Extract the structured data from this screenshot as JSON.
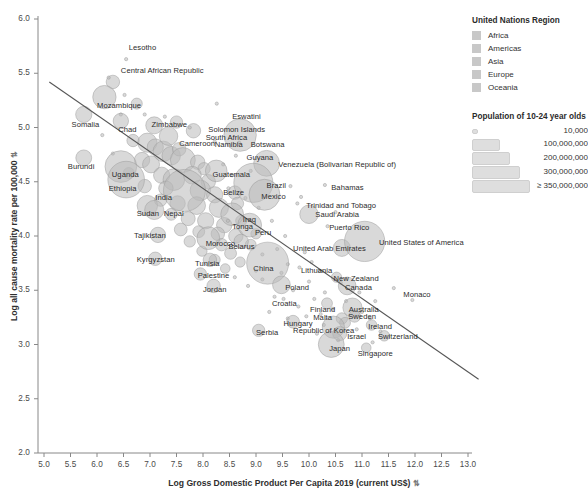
{
  "chart_data": {
    "type": "scatter",
    "title": "",
    "xlabel": "Log Gross Domestic Product Per Capita 2019 (current US$)",
    "ylabel": "Log all cause mortality rate per 100,000",
    "xlim": [
      5.0,
      13.0
    ],
    "ylim": [
      2.0,
      6.0
    ],
    "xticks": [
      "5.0",
      "5.5",
      "6.0",
      "6.5",
      "7.0",
      "7.5",
      "8.0",
      "8.5",
      "9.0",
      "9.5",
      "10.0",
      "10.5",
      "11.0",
      "11.5",
      "12.0",
      "12.5",
      "13.0"
    ],
    "yticks": [
      "2.0",
      "2.5",
      "3.0",
      "3.5",
      "4.0",
      "4.5",
      "5.0",
      "5.5",
      "6.0"
    ],
    "grid": false,
    "trendline": {
      "x1": 5.1,
      "y1": 5.42,
      "x2": 13.2,
      "y2": 2.68
    },
    "points": [
      {
        "label": "Lesotho",
        "x": 6.55,
        "y": 5.63,
        "size": 10000,
        "lx": 6.6,
        "ly": 5.73
      },
      {
        "label": "Central African Republic",
        "x": 6.22,
        "y": 5.46,
        "size": 12000,
        "lx": 6.45,
        "ly": 5.52
      },
      {
        "label": "Mozambique",
        "x": 6.14,
        "y": 5.28,
        "size": 95000000,
        "lx": 6.0,
        "ly": 5.2
      },
      {
        "label": "Eswatini",
        "x": 8.26,
        "y": 5.22,
        "size": 9000,
        "lx": 8.55,
        "ly": 5.1
      },
      {
        "label": "Somalia",
        "x": 5.75,
        "y": 5.12,
        "size": 40000000,
        "lx": 5.52,
        "ly": 5.02
      },
      {
        "label": "Chad",
        "x": 6.45,
        "y": 5.06,
        "size": 35000000,
        "lx": 6.4,
        "ly": 4.98
      },
      {
        "label": "Zimbabwe",
        "x": 7.08,
        "y": 5.02,
        "size": 45000000,
        "lx": 7.03,
        "ly": 5.02
      },
      {
        "label": "Solomon Islands",
        "x": 7.75,
        "y": 5.0,
        "size": 9000,
        "lx": 8.1,
        "ly": 4.98
      },
      {
        "label": "South Africa",
        "x": 8.7,
        "y": 4.93,
        "size": 200000000,
        "lx": 8.05,
        "ly": 4.9
      },
      {
        "label": "Cameroon",
        "x": 7.35,
        "y": 4.92,
        "size": 55000000,
        "lx": 7.55,
        "ly": 4.85
      },
      {
        "label": "Namibia",
        "x": 8.22,
        "y": 4.87,
        "size": 10000,
        "lx": 8.22,
        "ly": 4.84
      },
      {
        "label": "Botswana",
        "x": 8.68,
        "y": 4.86,
        "size": 11000,
        "lx": 8.9,
        "ly": 4.84
      },
      {
        "label": "Guyana",
        "x": 8.62,
        "y": 4.74,
        "size": 9000,
        "lx": 8.82,
        "ly": 4.72
      },
      {
        "label": "Burundi",
        "x": 5.75,
        "y": 4.72,
        "size": 38000000,
        "lx": 5.45,
        "ly": 4.64
      },
      {
        "label": "Venezuela (Bolivarian Republic of)",
        "x": 9.2,
        "y": 4.67,
        "size": 120000000,
        "lx": 9.42,
        "ly": 4.65
      },
      {
        "label": "Uganda",
        "x": 6.45,
        "y": 4.64,
        "size": 190000000,
        "lx": 6.28,
        "ly": 4.56
      },
      {
        "label": "Guatemala",
        "x": 8.25,
        "y": 4.6,
        "size": 80000000,
        "lx": 8.18,
        "ly": 4.56
      },
      {
        "label": "Ethiopia",
        "x": 6.55,
        "y": 4.52,
        "size": 260000000,
        "lx": 6.22,
        "ly": 4.43
      },
      {
        "label": "Brazil",
        "x": 8.95,
        "y": 4.49,
        "size": 300000000,
        "lx": 9.2,
        "ly": 4.46
      },
      {
        "label": "Bahamas",
        "x": 10.3,
        "y": 4.47,
        "size": 8000,
        "lx": 10.42,
        "ly": 4.44
      },
      {
        "label": "India",
        "x": 7.65,
        "y": 4.42,
        "size": 350000000,
        "lx": 7.1,
        "ly": 4.35
      },
      {
        "label": "Belize",
        "x": 8.48,
        "y": 4.44,
        "size": 9000,
        "lx": 8.38,
        "ly": 4.4
      },
      {
        "label": "Mexico",
        "x": 9.16,
        "y": 4.38,
        "size": 180000000,
        "lx": 9.1,
        "ly": 4.36
      },
      {
        "label": "Trinidad and Tobago",
        "x": 9.78,
        "y": 4.3,
        "size": 9000,
        "lx": 9.95,
        "ly": 4.28
      },
      {
        "label": "Sudan",
        "x": 6.95,
        "y": 4.28,
        "size": 70000000,
        "lx": 6.75,
        "ly": 4.2
      },
      {
        "label": "Nepal",
        "x": 7.08,
        "y": 4.24,
        "size": 60000000,
        "lx": 7.26,
        "ly": 4.2
      },
      {
        "label": "Saudi Arabia",
        "x": 10.0,
        "y": 4.2,
        "size": 55000000,
        "lx": 10.12,
        "ly": 4.19
      },
      {
        "label": "Iraq",
        "x": 8.55,
        "y": 4.2,
        "size": 90000000,
        "lx": 8.75,
        "ly": 4.15
      },
      {
        "label": "Tonga",
        "x": 8.47,
        "y": 4.14,
        "size": 8000,
        "lx": 8.55,
        "ly": 4.08
      },
      {
        "label": "Peru",
        "x": 8.88,
        "y": 4.1,
        "size": 100000000,
        "lx": 8.98,
        "ly": 4.03
      },
      {
        "label": "Puerto Rico",
        "x": 10.35,
        "y": 4.09,
        "size": 9000,
        "lx": 10.38,
        "ly": 4.07
      },
      {
        "label": "Tajikistan",
        "x": 7.15,
        "y": 4.01,
        "size": 35000000,
        "lx": 6.7,
        "ly": 4.0
      },
      {
        "label": "Morocco",
        "x": 8.1,
        "y": 3.98,
        "size": 90000000,
        "lx": 8.05,
        "ly": 3.93
      },
      {
        "label": "Belarus",
        "x": 8.72,
        "y": 3.95,
        "size": 30000000,
        "lx": 8.48,
        "ly": 3.9
      },
      {
        "label": "United Arab Emirates",
        "x": 10.62,
        "y": 3.89,
        "size": 45000000,
        "lx": 9.7,
        "ly": 3.88
      },
      {
        "label": "United States of America",
        "x": 11.05,
        "y": 3.95,
        "size": 320000000,
        "lx": 11.32,
        "ly": 3.94
      },
      {
        "label": "Kyrgyzstan",
        "x": 7.1,
        "y": 3.79,
        "size": 25000000,
        "lx": 6.75,
        "ly": 3.78
      },
      {
        "label": "Tunisia",
        "x": 8.13,
        "y": 3.78,
        "size": 25000000,
        "lx": 7.85,
        "ly": 3.74
      },
      {
        "label": "China",
        "x": 9.22,
        "y": 3.75,
        "size": 350000000,
        "lx": 8.95,
        "ly": 3.7
      },
      {
        "label": "Lithuania",
        "x": 9.82,
        "y": 3.71,
        "size": 9000,
        "lx": 9.85,
        "ly": 3.68
      },
      {
        "label": "Palestine",
        "x": 7.95,
        "y": 3.65,
        "size": 20000000,
        "lx": 7.9,
        "ly": 3.63
      },
      {
        "label": "New Zealand",
        "x": 10.52,
        "y": 3.62,
        "size": 12000000,
        "lx": 10.46,
        "ly": 3.6
      },
      {
        "label": "Poland",
        "x": 9.48,
        "y": 3.55,
        "size": 50000000,
        "lx": 9.55,
        "ly": 3.52
      },
      {
        "label": "Canada",
        "x": 10.72,
        "y": 3.54,
        "size": 50000000,
        "lx": 10.68,
        "ly": 3.52
      },
      {
        "label": "Jordan",
        "x": 8.2,
        "y": 3.54,
        "size": 25000000,
        "lx": 8.0,
        "ly": 3.5
      },
      {
        "label": "Monaco",
        "x": 11.95,
        "y": 3.41,
        "size": 6000,
        "lx": 11.78,
        "ly": 3.46
      },
      {
        "label": "Croatia",
        "x": 9.52,
        "y": 3.42,
        "size": 9000,
        "lx": 9.3,
        "ly": 3.37
      },
      {
        "label": "Finland",
        "x": 10.34,
        "y": 3.38,
        "size": 14000000,
        "lx": 10.02,
        "ly": 3.32
      },
      {
        "label": "Australia",
        "x": 10.82,
        "y": 3.34,
        "size": 60000000,
        "lx": 10.75,
        "ly": 3.32
      },
      {
        "label": "Malta",
        "x": 10.22,
        "y": 3.28,
        "size": 7000,
        "lx": 10.08,
        "ly": 3.24
      },
      {
        "label": "Sweden",
        "x": 10.86,
        "y": 3.26,
        "size": 18000000,
        "lx": 10.74,
        "ly": 3.25
      },
      {
        "label": "Hungary",
        "x": 9.7,
        "y": 3.21,
        "size": 22000000,
        "lx": 9.52,
        "ly": 3.19
      },
      {
        "label": "Republic of Korea",
        "x": 10.46,
        "y": 3.16,
        "size": 85000000,
        "lx": 9.7,
        "ly": 3.12
      },
      {
        "label": "Serbia",
        "x": 9.05,
        "y": 3.13,
        "size": 20000000,
        "lx": 9.0,
        "ly": 3.11
      },
      {
        "label": "Ireland",
        "x": 11.18,
        "y": 3.18,
        "size": 13000000,
        "lx": 11.12,
        "ly": 3.16
      },
      {
        "label": "Israel",
        "x": 10.58,
        "y": 3.1,
        "size": 28000000,
        "lx": 10.72,
        "ly": 3.07
      },
      {
        "label": "Switzerland",
        "x": 11.42,
        "y": 3.08,
        "size": 13000000,
        "lx": 11.3,
        "ly": 3.07
      },
      {
        "label": "Japan",
        "x": 10.42,
        "y": 3.0,
        "size": 120000000,
        "lx": 10.38,
        "ly": 2.96
      },
      {
        "label": "Singapore",
        "x": 11.08,
        "y": 2.97,
        "size": 10000000,
        "lx": 10.92,
        "ly": 2.91
      }
    ],
    "extra_points": [
      {
        "x": 6.3,
        "y": 5.42,
        "size": 25000000
      },
      {
        "x": 6.52,
        "y": 5.3,
        "size": 12000
      },
      {
        "x": 6.75,
        "y": 5.22,
        "size": 15000000
      },
      {
        "x": 6.9,
        "y": 5.12,
        "size": 10000
      },
      {
        "x": 7.28,
        "y": 5.1,
        "size": 9000
      },
      {
        "x": 7.5,
        "y": 5.05,
        "size": 20000000
      },
      {
        "x": 7.82,
        "y": 4.97,
        "size": 30000000
      },
      {
        "x": 6.1,
        "y": 4.93,
        "size": 12000
      },
      {
        "x": 6.68,
        "y": 4.88,
        "size": 20000000
      },
      {
        "x": 6.95,
        "y": 4.86,
        "size": 60000000
      },
      {
        "x": 7.1,
        "y": 4.82,
        "size": 40000000
      },
      {
        "x": 7.25,
        "y": 4.78,
        "size": 70000000
      },
      {
        "x": 7.4,
        "y": 4.74,
        "size": 55000000
      },
      {
        "x": 7.55,
        "y": 4.8,
        "size": 25000000
      },
      {
        "x": 6.3,
        "y": 4.76,
        "size": 9000
      },
      {
        "x": 6.85,
        "y": 4.7,
        "size": 35000000
      },
      {
        "x": 7.02,
        "y": 4.66,
        "size": 45000000
      },
      {
        "x": 7.62,
        "y": 4.7,
        "size": 110000000
      },
      {
        "x": 7.9,
        "y": 4.68,
        "size": 30000000
      },
      {
        "x": 8.02,
        "y": 4.62,
        "size": 20000000
      },
      {
        "x": 8.38,
        "y": 4.66,
        "size": 9000
      },
      {
        "x": 6.6,
        "y": 4.58,
        "size": 15000000
      },
      {
        "x": 7.22,
        "y": 4.56,
        "size": 40000000
      },
      {
        "x": 7.45,
        "y": 4.52,
        "size": 80000000
      },
      {
        "x": 7.8,
        "y": 4.56,
        "size": 50000000
      },
      {
        "x": 8.1,
        "y": 4.5,
        "size": 30000000
      },
      {
        "x": 8.55,
        "y": 4.56,
        "size": 9000
      },
      {
        "x": 6.9,
        "y": 4.46,
        "size": 25000000
      },
      {
        "x": 7.3,
        "y": 4.44,
        "size": 30000000
      },
      {
        "x": 7.95,
        "y": 4.42,
        "size": 70000000
      },
      {
        "x": 8.22,
        "y": 4.38,
        "size": 40000000
      },
      {
        "x": 8.6,
        "y": 4.4,
        "size": 25000000
      },
      {
        "x": 8.8,
        "y": 4.35,
        "size": 12000
      },
      {
        "x": 7.2,
        "y": 4.33,
        "size": 20000000
      },
      {
        "x": 7.52,
        "y": 4.3,
        "size": 35000000
      },
      {
        "x": 7.88,
        "y": 4.28,
        "size": 50000000
      },
      {
        "x": 8.3,
        "y": 4.26,
        "size": 60000000
      },
      {
        "x": 8.65,
        "y": 4.3,
        "size": 20000000
      },
      {
        "x": 9.05,
        "y": 4.26,
        "size": 10000
      },
      {
        "x": 7.4,
        "y": 4.2,
        "size": 18000000
      },
      {
        "x": 7.72,
        "y": 4.16,
        "size": 28000000
      },
      {
        "x": 8.05,
        "y": 4.14,
        "size": 40000000
      },
      {
        "x": 8.4,
        "y": 4.1,
        "size": 35000000
      },
      {
        "x": 8.72,
        "y": 4.14,
        "size": 15000000
      },
      {
        "x": 9.3,
        "y": 4.14,
        "size": 9000
      },
      {
        "x": 7.58,
        "y": 4.06,
        "size": 22000000
      },
      {
        "x": 7.92,
        "y": 4.04,
        "size": 18000000
      },
      {
        "x": 8.28,
        "y": 4.02,
        "size": 25000000
      },
      {
        "x": 8.62,
        "y": 4.0,
        "size": 30000000
      },
      {
        "x": 9.0,
        "y": 4.02,
        "size": 12000000
      },
      {
        "x": 9.55,
        "y": 4.0,
        "size": 8000
      },
      {
        "x": 7.75,
        "y": 3.95,
        "size": 16000000
      },
      {
        "x": 8.35,
        "y": 3.92,
        "size": 20000000
      },
      {
        "x": 8.9,
        "y": 3.92,
        "size": 14000000
      },
      {
        "x": 9.4,
        "y": 3.88,
        "size": 10000
      },
      {
        "x": 7.98,
        "y": 3.86,
        "size": 12000000
      },
      {
        "x": 8.52,
        "y": 3.84,
        "size": 18000000
      },
      {
        "x": 9.12,
        "y": 3.83,
        "size": 9000
      },
      {
        "x": 9.92,
        "y": 3.85,
        "size": 9000
      },
      {
        "x": 8.22,
        "y": 3.78,
        "size": 15000000
      },
      {
        "x": 8.7,
        "y": 3.76,
        "size": 12000000
      },
      {
        "x": 9.6,
        "y": 3.74,
        "size": 8000
      },
      {
        "x": 10.05,
        "y": 3.76,
        "size": 9000
      },
      {
        "x": 8.42,
        "y": 3.7,
        "size": 10000000
      },
      {
        "x": 9.0,
        "y": 3.68,
        "size": 9000
      },
      {
        "x": 9.48,
        "y": 3.66,
        "size": 8000
      },
      {
        "x": 10.2,
        "y": 3.68,
        "size": 9000
      },
      {
        "x": 8.6,
        "y": 3.62,
        "size": 9000
      },
      {
        "x": 9.12,
        "y": 3.6,
        "size": 10000
      },
      {
        "x": 10.0,
        "y": 3.58,
        "size": 9000
      },
      {
        "x": 10.6,
        "y": 3.57,
        "size": 12000
      },
      {
        "x": 8.85,
        "y": 3.54,
        "size": 8000
      },
      {
        "x": 9.7,
        "y": 3.5,
        "size": 9000
      },
      {
        "x": 10.3,
        "y": 3.48,
        "size": 8000
      },
      {
        "x": 10.95,
        "y": 3.48,
        "size": 9000
      },
      {
        "x": 9.35,
        "y": 3.44,
        "size": 8000
      },
      {
        "x": 10.1,
        "y": 3.42,
        "size": 9000
      },
      {
        "x": 10.7,
        "y": 3.4,
        "size": 8000
      },
      {
        "x": 11.25,
        "y": 3.4,
        "size": 8000
      },
      {
        "x": 9.8,
        "y": 3.35,
        "size": 8000
      },
      {
        "x": 10.45,
        "y": 3.33,
        "size": 9000
      },
      {
        "x": 11.0,
        "y": 3.3,
        "size": 9000
      },
      {
        "x": 9.95,
        "y": 3.26,
        "size": 8000
      },
      {
        "x": 10.62,
        "y": 3.24,
        "size": 16000000
      },
      {
        "x": 10.68,
        "y": 3.2,
        "size": 14000000
      },
      {
        "x": 11.15,
        "y": 3.24,
        "size": 9000
      },
      {
        "x": 10.28,
        "y": 3.18,
        "size": 9000
      },
      {
        "x": 10.9,
        "y": 3.14,
        "size": 9000
      },
      {
        "x": 11.35,
        "y": 3.12,
        "size": 9000
      },
      {
        "x": 10.15,
        "y": 3.1,
        "size": 9000
      },
      {
        "x": 10.55,
        "y": 3.04,
        "size": 9000
      },
      {
        "x": 11.2,
        "y": 3.02,
        "size": 8000
      },
      {
        "x": 9.25,
        "y": 3.3,
        "size": 8000
      },
      {
        "x": 9.6,
        "y": 3.24,
        "size": 8000
      },
      {
        "x": 6.45,
        "y": 5.12,
        "size": 9000
      },
      {
        "x": 8.9,
        "y": 4.6,
        "size": 9000
      },
      {
        "x": 9.65,
        "y": 4.46,
        "size": 9000
      },
      {
        "x": 9.85,
        "y": 4.36,
        "size": 8000
      },
      {
        "x": 10.5,
        "y": 4.22,
        "size": 8000
      },
      {
        "x": 11.6,
        "y": 3.52,
        "size": 7000
      }
    ]
  },
  "legend": {
    "region_title": "United Nations Region",
    "regions": [
      {
        "label": "Africa",
        "color": "#c8c8c8"
      },
      {
        "label": "Americas",
        "color": "#c8c8c8"
      },
      {
        "label": "Asia",
        "color": "#c8c8c8"
      },
      {
        "label": "Europe",
        "color": "#c8c8c8"
      },
      {
        "label": "Oceania",
        "color": "#c8c8c8"
      }
    ],
    "size_title": "Population of 10-24 year olds",
    "sizes": [
      {
        "label": "10,000",
        "w": 4,
        "h": 3
      },
      {
        "label": "100,000,000",
        "w": 26,
        "h": 10
      },
      {
        "label": "200,000,000",
        "w": 36,
        "h": 11
      },
      {
        "label": "300,000,000",
        "w": 46,
        "h": 11
      },
      {
        "label": "≥ 350,000,000",
        "w": 56,
        "h": 11
      }
    ]
  },
  "axes": {
    "x_title": "Log Gross Domestic Product Per Capita 2019 (current US$)",
    "y_title": "Log all cause mortality rate per 100,000",
    "sort_glyph": "⇅"
  }
}
